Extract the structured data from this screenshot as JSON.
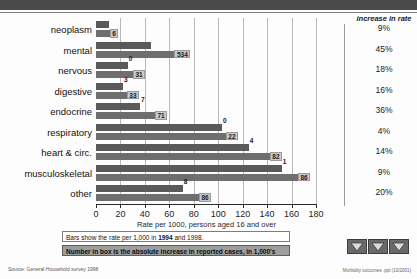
{
  "slide": {
    "filename_footer": "Morbidity outcomes .ppt (10/2001)",
    "source": "Source: General Household survey 1998"
  },
  "notes": {
    "note1_prefix": "Bars show the rate per 1,000 in ",
    "note1_year1": "1994",
    "note1_mid": " and ",
    "note1_year2": "1998",
    "note1_suffix": ".",
    "note2": "Number in box is the absolute increase in reported cases, in 1,000's"
  },
  "right_column": {
    "header": "increase in rate",
    "values": [
      "9%",
      "45%",
      "18%",
      "16%",
      "36%",
      "4%",
      "14%",
      "9%",
      "20%"
    ]
  },
  "nav": {
    "back_label": "back",
    "down_label": "down",
    "forward_label": "forward"
  },
  "chart_data": {
    "type": "bar",
    "title": "",
    "xlabel": "Rate per 1000, persons aged 16 and over",
    "ylabel": "",
    "xlim": [
      0,
      180
    ],
    "xticks": [
      "0",
      "20",
      "40",
      "60",
      "80",
      "100",
      "120",
      "140",
      "160",
      "180"
    ],
    "xtick_values": [
      0,
      20,
      40,
      60,
      80,
      100,
      120,
      140,
      160,
      180
    ],
    "grid": true,
    "legend": "none",
    "orientation": "horizontal",
    "categories": [
      "neoplasm",
      "mental",
      "nervous",
      "digestive",
      "endocrine",
      "respiratory",
      "heart & circ.",
      "musculoskeletal",
      "other"
    ],
    "series": [
      {
        "name": "1994",
        "values": [
          11,
          45,
          26,
          22,
          36,
          103,
          125,
          152,
          71
        ]
      },
      {
        "name": "1998",
        "values": [
          12,
          65,
          31,
          26,
          49,
          107,
          143,
          166,
          85
        ]
      }
    ],
    "box_labels": [
      "6",
      "534",
      "31",
      "33",
      "71",
      "22",
      "82",
      "86",
      "86"
    ],
    "plain_labels": [
      "",
      "",
      "0",
      "3",
      "7",
      "0",
      "4",
      "1",
      "8"
    ],
    "box_label_caption": "absolute increase in reported cases, in 1,000's"
  }
}
